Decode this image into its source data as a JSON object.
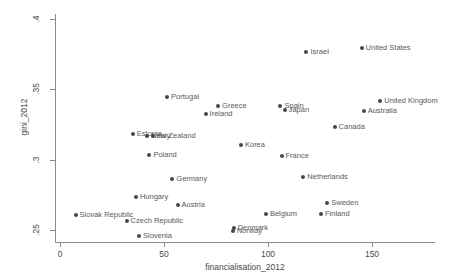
{
  "chart_data": {
    "type": "scatter",
    "title": "",
    "xlabel": "financialisation_2012",
    "ylabel": "gini_2012",
    "xlim": [
      -5,
      170
    ],
    "ylim": [
      0.243,
      0.402
    ],
    "xticks": [
      0,
      50,
      100,
      150
    ],
    "xtick_labels": [
      "0",
      "50",
      "100",
      "150"
    ],
    "yticks": [
      0.25,
      0.3,
      0.35,
      0.4
    ],
    "ytick_labels": [
      ".25",
      ".3",
      ".35",
      ".4"
    ],
    "grid": false,
    "legend": "none",
    "marker_color": "#474747",
    "label_color": "#5a5a5a",
    "axis_color": "#8c8c8c",
    "points": [
      {
        "label": "Israel",
        "x": 118.5,
        "y": 0.3765
      },
      {
        "label": "United States",
        "x": 145.0,
        "y": 0.3795
      },
      {
        "label": "United Kingdom",
        "x": 154.0,
        "y": 0.3415
      },
      {
        "label": "Australia",
        "x": 146.0,
        "y": 0.3345
      },
      {
        "label": "Canada",
        "x": 132.0,
        "y": 0.3235
      },
      {
        "label": "Spain",
        "x": 106.0,
        "y": 0.3385
      },
      {
        "label": "Japan",
        "x": 108.0,
        "y": 0.3355
      },
      {
        "label": "Portugal",
        "x": 51.5,
        "y": 0.3445
      },
      {
        "label": "Greece",
        "x": 76.0,
        "y": 0.3385
      },
      {
        "label": "Ireland",
        "x": 70.0,
        "y": 0.3325
      },
      {
        "label": "Estonia",
        "x": 35.0,
        "y": 0.3185
      },
      {
        "label": "New Zealand",
        "x": 42.0,
        "y": 0.3165
      },
      {
        "label": "Italy",
        "x": 44.5,
        "y": 0.317
      },
      {
        "label": "Korea",
        "x": 87.0,
        "y": 0.3105
      },
      {
        "label": "Poland",
        "x": 43.0,
        "y": 0.3035
      },
      {
        "label": "France",
        "x": 106.5,
        "y": 0.3025
      },
      {
        "label": "Netherlands",
        "x": 117.0,
        "y": 0.288
      },
      {
        "label": "Germany",
        "x": 54.0,
        "y": 0.2865
      },
      {
        "label": "Hungary",
        "x": 36.5,
        "y": 0.2735
      },
      {
        "label": "Austria",
        "x": 56.5,
        "y": 0.268
      },
      {
        "label": "Sweden",
        "x": 128.5,
        "y": 0.2695
      },
      {
        "label": "Finland",
        "x": 125.5,
        "y": 0.2615
      },
      {
        "label": "Belgium",
        "x": 99.0,
        "y": 0.2615
      },
      {
        "label": "Slovak Republic",
        "x": 7.5,
        "y": 0.2605
      },
      {
        "label": "Czech Republic",
        "x": 32.0,
        "y": 0.2565
      },
      {
        "label": "Denmark",
        "x": 83.5,
        "y": 0.2515
      },
      {
        "label": "Norway",
        "x": 83.0,
        "y": 0.249
      },
      {
        "label": "Slovenia",
        "x": 38.0,
        "y": 0.2455
      }
    ]
  }
}
